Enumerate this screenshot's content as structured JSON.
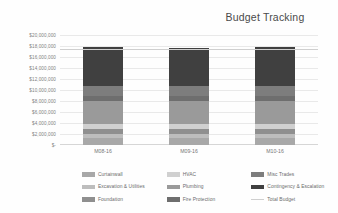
{
  "chart_data": {
    "type": "bar",
    "title": "Budget Tracking",
    "xlabel": "",
    "ylabel": "",
    "ylim": [
      0,
      20000000
    ],
    "ytick_labels": [
      "$20,000,000",
      "$18,000,000",
      "$16,000,000",
      "$14,000,000",
      "$12,000,000",
      "$10,000,000",
      "$8,000,000",
      "$6,000,000",
      "$4,000,000",
      "$2,000,000",
      "$-"
    ],
    "ytick_values": [
      20000000,
      18000000,
      16000000,
      14000000,
      12000000,
      10000000,
      8000000,
      6000000,
      4000000,
      2000000,
      0
    ],
    "grid": true,
    "stacked": true,
    "legend_position": "bottom",
    "categories": [
      "M08-16",
      "M09-16",
      "M10-16"
    ],
    "series": [
      {
        "name": "Curtainwall",
        "color": "#a8a8a8",
        "values": [
          1300000,
          1300000,
          1300000
        ]
      },
      {
        "name": "Excavation & Utilities",
        "color": "#bdbdbd",
        "values": [
          700000,
          700000,
          700000
        ]
      },
      {
        "name": "Foundation",
        "color": "#8f8f8f",
        "values": [
          900000,
          900000,
          900000
        ]
      },
      {
        "name": "HVAC",
        "color": "#d0d0d0",
        "values": [
          900000,
          900000,
          900000
        ]
      },
      {
        "name": "Plumbing",
        "color": "#9a9a9a",
        "values": [
          4200000,
          4200000,
          4200000
        ]
      },
      {
        "name": "Fire Protection",
        "color": "#6e6e6e",
        "values": [
          900000,
          900000,
          900000
        ]
      },
      {
        "name": "Misc Trades",
        "color": "#7d7d7d",
        "values": [
          1900000,
          1900000,
          1900000
        ]
      },
      {
        "name": "Contingency & Escalation",
        "color": "#404040",
        "values": [
          7000000,
          6800000,
          7100000
        ]
      }
    ],
    "reference_line": {
      "name": "Total Budget",
      "color": "#cfcfcf",
      "value": 17500000
    },
    "totals": [
      17800000,
      17600000,
      17900000
    ]
  },
  "legend": {
    "items": [
      {
        "label": "Curtainwall",
        "color": "#a8a8a8",
        "type": "swatch"
      },
      {
        "label": "Excavation & Utilities",
        "color": "#bdbdbd",
        "type": "swatch"
      },
      {
        "label": "Foundation",
        "color": "#8f8f8f",
        "type": "swatch"
      },
      {
        "label": "HVAC",
        "color": "#d0d0d0",
        "type": "swatch"
      },
      {
        "label": "Plumbing",
        "color": "#9a9a9a",
        "type": "swatch"
      },
      {
        "label": "Fire Protection",
        "color": "#6e6e6e",
        "type": "swatch"
      },
      {
        "label": "Misc Trades",
        "color": "#7d7d7d",
        "type": "swatch"
      },
      {
        "label": "Contingency & Escalation",
        "color": "#404040",
        "type": "swatch"
      },
      {
        "label": "Total Budget",
        "color": "#cfcfcf",
        "type": "line"
      }
    ]
  }
}
